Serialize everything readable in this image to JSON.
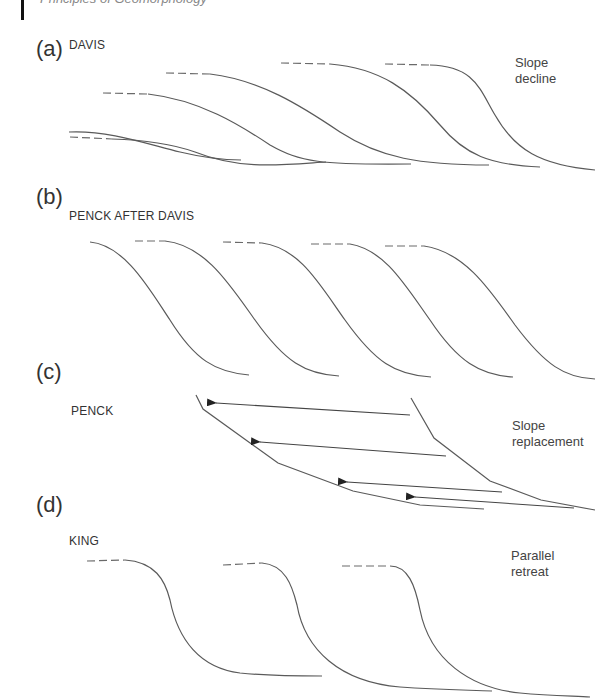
{
  "header": {
    "text": "Principles of Geomorphology"
  },
  "panels": [
    {
      "letter": "(a)",
      "title": "DAVIS",
      "side_label_line1": "Slope",
      "side_label_line2": "decline"
    },
    {
      "letter": "(b)",
      "title": "PENCK AFTER DAVIS",
      "side_label_line1": "",
      "side_label_line2": ""
    },
    {
      "letter": "(c)",
      "title": "PENCK",
      "side_label_line1": "Slope",
      "side_label_line2": "replacement"
    },
    {
      "letter": "(d)",
      "title": "KING",
      "side_label_line1": "Parallel",
      "side_label_line2": "retreat"
    }
  ],
  "colors": {
    "line": "#5a5a5a",
    "text": "#333333",
    "arrow": "#444444"
  }
}
